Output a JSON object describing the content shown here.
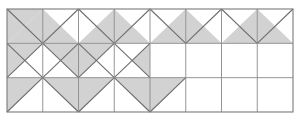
{
  "figure": {
    "type": "geometric-grid-diagram",
    "colors": {
      "shaded_fill": "#d2d2d2",
      "unshaded_fill": "#ffffff",
      "grid_line": "#8a8a8a",
      "diagonal_line": "#6e6e6e",
      "border": "#7a7a7a",
      "background": "#ffffff"
    },
    "grid": {
      "columns": 8,
      "rows": 3,
      "origin_x": 7,
      "origin_y": 9,
      "cell_width": 35.75,
      "cell_height": 34.33,
      "total_width": 286,
      "total_height": 103
    },
    "line_widths": {
      "grid": 0.9,
      "diagonal": 1.1,
      "border": 1.1
    },
    "cells": [
      {
        "col": 0,
        "row": 0,
        "diagonals": "main",
        "shaded": [
          "upper-left",
          "lower-right"
        ]
      },
      {
        "col": 1,
        "row": 0,
        "diagonals": "anti",
        "shaded": [
          "lower-left"
        ]
      },
      {
        "col": 2,
        "row": 0,
        "diagonals": "main",
        "shaded": [
          "lower-right"
        ]
      },
      {
        "col": 3,
        "row": 0,
        "diagonals": "anti",
        "shaded": [
          "lower-left"
        ]
      },
      {
        "col": 4,
        "row": 0,
        "diagonals": "main",
        "shaded": [
          "lower-right"
        ]
      },
      {
        "col": 5,
        "row": 0,
        "diagonals": "anti",
        "shaded": [
          "lower-left"
        ]
      },
      {
        "col": 6,
        "row": 0,
        "diagonals": "main",
        "shaded": [
          "lower-right"
        ]
      },
      {
        "col": 7,
        "row": 0,
        "diagonals": "anti",
        "shaded": [
          "lower-left"
        ]
      },
      {
        "col": 0,
        "row": 1,
        "diagonals": "both",
        "shaded": [
          "left",
          "top"
        ]
      },
      {
        "col": 1,
        "row": 1,
        "diagonals": "both",
        "shaded": [
          "right",
          "top"
        ]
      },
      {
        "col": 2,
        "row": 1,
        "diagonals": "both",
        "shaded": [
          "left",
          "top"
        ]
      },
      {
        "col": 3,
        "row": 1,
        "diagonals": "both",
        "shaded": [
          "right"
        ]
      },
      {
        "col": 4,
        "row": 1,
        "diagonals": "none",
        "shaded": []
      },
      {
        "col": 5,
        "row": 1,
        "diagonals": "none",
        "shaded": []
      },
      {
        "col": 6,
        "row": 1,
        "diagonals": "none",
        "shaded": []
      },
      {
        "col": 7,
        "row": 1,
        "diagonals": "none",
        "shaded": []
      },
      {
        "col": 0,
        "row": 2,
        "diagonals": "anti",
        "shaded": [
          "upper-left"
        ]
      },
      {
        "col": 1,
        "row": 2,
        "diagonals": "main",
        "shaded": [
          "upper-right"
        ]
      },
      {
        "col": 2,
        "row": 2,
        "diagonals": "anti",
        "shaded": [
          "upper-left"
        ]
      },
      {
        "col": 3,
        "row": 2,
        "diagonals": "main",
        "shaded": [
          "upper-right"
        ]
      },
      {
        "col": 4,
        "row": 2,
        "diagonals": "anti",
        "shaded": [
          "upper-left"
        ]
      },
      {
        "col": 5,
        "row": 2,
        "diagonals": "none",
        "shaded": []
      },
      {
        "col": 6,
        "row": 2,
        "diagonals": "none",
        "shaded": []
      },
      {
        "col": 7,
        "row": 2,
        "diagonals": "none",
        "shaded": []
      }
    ]
  }
}
